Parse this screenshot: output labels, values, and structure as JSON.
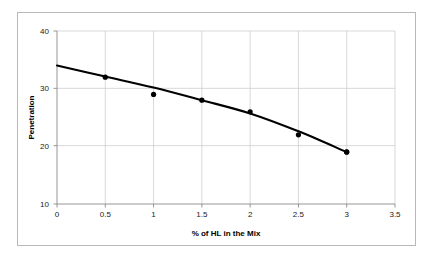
{
  "chart_data": {
    "type": "scatter",
    "title": "",
    "xlabel": "% of HL in the Mix",
    "ylabel": "Penetration",
    "xlim": [
      0,
      3.5
    ],
    "ylim": [
      10,
      40
    ],
    "xticks": [
      "0",
      "0.5",
      "1",
      "1.5",
      "2",
      "2.5",
      "3",
      "3.5"
    ],
    "xtick_values": [
      0,
      0.5,
      1,
      1.5,
      2,
      2.5,
      3,
      3.5
    ],
    "yticks": [
      "10",
      "20",
      "30",
      "40"
    ],
    "ytick_values": [
      10,
      20,
      30,
      40
    ],
    "grid": true,
    "legend": "none",
    "series": [
      {
        "name": "Penetration",
        "marker": "filled-diamond",
        "color": "#000000",
        "x": [
          0,
          0.5,
          1,
          1.5,
          2,
          2.5,
          3
        ],
        "values": [
          34,
          32,
          29,
          28,
          26,
          22,
          19
        ]
      }
    ],
    "trend_line": {
      "name": "fitted curve",
      "color": "#000000",
      "x": [
        0,
        0.5,
        1,
        1.5,
        2,
        2.5,
        3
      ],
      "values": [
        34,
        32.1,
        30.2,
        28,
        25.7,
        22.6,
        19
      ]
    }
  },
  "figure": {
    "background_color": "#ffffff",
    "border_color": "#b9b9b9",
    "gridline_color": "#c8c8c8",
    "axis_color": "#8a8a8a",
    "series_color": "#000000"
  }
}
